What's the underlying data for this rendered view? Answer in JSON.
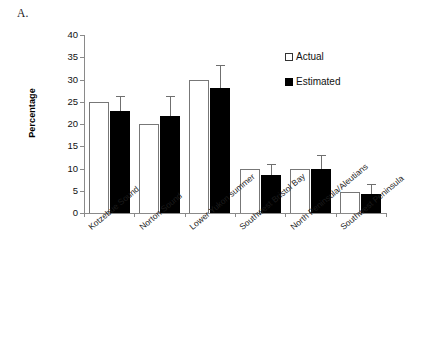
{
  "figure": {
    "panel_letter": "A.",
    "y_axis_title": "Percentage"
  },
  "legend": {
    "position": "inside-top-right",
    "items": [
      {
        "label": "Actual",
        "swatch": "open-square",
        "color": "#ffffff"
      },
      {
        "label": "Estimated",
        "swatch": "filled-square",
        "color": "#000000"
      }
    ]
  },
  "chart_data": {
    "type": "bar",
    "title": "",
    "xlabel": "",
    "ylabel": "Percentage",
    "ylim": [
      0,
      40
    ],
    "yticks": [
      0,
      5,
      10,
      15,
      20,
      25,
      30,
      35,
      40
    ],
    "ytick_labels": [
      "0",
      "5",
      "10",
      "15",
      "20",
      "25",
      "30",
      "35",
      "40"
    ],
    "grid": false,
    "legend_position": "inside-top-right",
    "categories": [
      "Kotzebue Sound",
      "Norton Sound",
      "Lower Yukon summer",
      "Southwest Bristol Bay",
      "North Peninsula/Aleutians",
      "Southwest Peninsula"
    ],
    "series": [
      {
        "name": "Actual",
        "color": "#ffffff",
        "values": [
          25.0,
          20.0,
          29.8,
          9.8,
          9.8,
          4.7
        ],
        "errors": [
          0,
          0,
          0,
          0,
          0,
          0
        ]
      },
      {
        "name": "Estimated",
        "color": "#000000",
        "values": [
          23.0,
          21.7,
          28.2,
          8.5,
          9.8,
          4.2
        ],
        "errors": [
          3.2,
          4.7,
          5.0,
          2.5,
          3.3,
          2.3
        ]
      }
    ]
  }
}
